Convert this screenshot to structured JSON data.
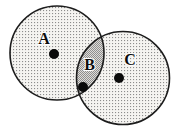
{
  "diagram": {
    "type": "venn-two-circles",
    "labels": {
      "left_set": "A",
      "intersection": "B",
      "right_set": "C"
    },
    "markers": {
      "left_set_point": "filled-dot",
      "intersection_point": "filled-dot",
      "right_set_point": "filled-dot"
    },
    "colors": {
      "background": "#ffffff",
      "outline": "#1c1c1c",
      "stipple_dot": "#8d8d8d",
      "stipple_bg": "#f5f4f1",
      "overlap_dot": "#8f8f8f",
      "overlap_bg": "#dedcd8",
      "marker": "#0a0a0a"
    }
  }
}
